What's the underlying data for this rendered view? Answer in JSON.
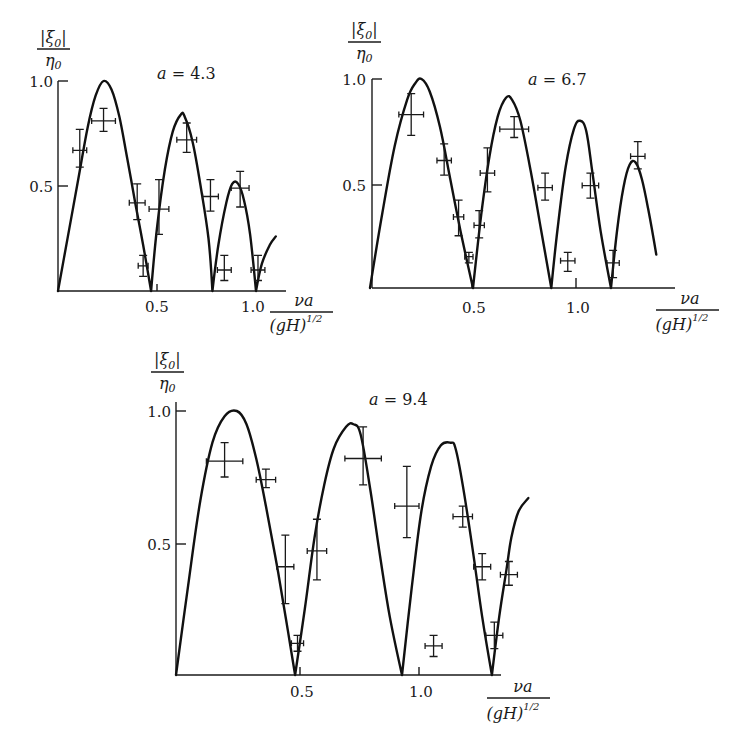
{
  "chart_data": [
    {
      "type": "line",
      "panel": "top-left",
      "title": "a = 4.3",
      "title_var": "a",
      "title_value": "4.3",
      "ylabel_numerator": "|ξ0|",
      "ylabel_denominator": "η0",
      "xlabel_numerator": "νa",
      "xlabel_denominator": "(gH)^1/2",
      "xticks": [
        0.5,
        1.0
      ],
      "xtick_labels": [
        "0.5",
        "1.0"
      ],
      "yticks": [
        0.5,
        1.0
      ],
      "ytick_labels": [
        "0.5",
        "1.0"
      ],
      "xlim": [
        0,
        1.16
      ],
      "ylim": [
        0,
        1.0
      ],
      "grid": false,
      "layout": {
        "x0": 58,
        "y0": 291,
        "sx": 198,
        "sy": 210
      },
      "series": [
        {
          "name": "theory",
          "kind": "curve",
          "x": [
            0,
            0.05,
            0.1,
            0.15,
            0.19,
            0.23,
            0.27,
            0.31,
            0.35,
            0.39,
            0.43,
            0.47,
            0.5,
            0.54,
            0.58,
            0.62,
            0.64,
            0.68,
            0.72,
            0.76,
            0.78,
            0.81,
            0.85,
            0.88,
            0.91,
            0.94,
            0.97,
            1.0,
            1.03,
            1.07,
            1.1
          ],
          "y": [
            0,
            0.26,
            0.52,
            0.78,
            0.93,
            1.0,
            0.96,
            0.83,
            0.63,
            0.42,
            0.22,
            0.0,
            0.3,
            0.58,
            0.76,
            0.84,
            0.83,
            0.71,
            0.5,
            0.25,
            0.0,
            0.22,
            0.42,
            0.51,
            0.51,
            0.43,
            0.27,
            0.0,
            0.13,
            0.22,
            0.26
          ]
        },
        {
          "name": "measured",
          "kind": "errorbar",
          "points": [
            {
              "x": 0.11,
              "y": 0.67,
              "xerr": 0.035,
              "ylo": 0.59,
              "yhi": 0.77
            },
            {
              "x": 0.23,
              "y": 0.81,
              "xerr": 0.06,
              "ylo": 0.76,
              "yhi": 0.87
            },
            {
              "x": 0.4,
              "y": 0.42,
              "xerr": 0.04,
              "ylo": 0.34,
              "yhi": 0.51
            },
            {
              "x": 0.43,
              "y": 0.12,
              "xerr": 0.025,
              "ylo": 0.07,
              "yhi": 0.17
            },
            {
              "x": 0.51,
              "y": 0.39,
              "xerr": 0.05,
              "ylo": 0.27,
              "yhi": 0.53
            },
            {
              "x": 0.65,
              "y": 0.72,
              "xerr": 0.05,
              "ylo": 0.66,
              "yhi": 0.8
            },
            {
              "x": 0.77,
              "y": 0.45,
              "xerr": 0.04,
              "ylo": 0.38,
              "yhi": 0.53
            },
            {
              "x": 0.84,
              "y": 0.1,
              "xerr": 0.035,
              "ylo": 0.05,
              "yhi": 0.17
            },
            {
              "x": 0.92,
              "y": 0.49,
              "xerr": 0.045,
              "ylo": 0.4,
              "yhi": 0.57
            },
            {
              "x": 1.01,
              "y": 0.1,
              "xerr": 0.035,
              "ylo": 0.05,
              "yhi": 0.17
            }
          ]
        }
      ]
    },
    {
      "type": "line",
      "panel": "top-right",
      "title": "a = 6.7",
      "title_var": "a",
      "title_value": "6.7",
      "ylabel_numerator": "|ξ0|",
      "ylabel_denominator": "η0",
      "xlabel_numerator": "νa",
      "xlabel_denominator": "(gH)^1/2",
      "xticks": [
        0.5,
        1.0
      ],
      "xtick_labels": [
        "0.5",
        "1.0"
      ],
      "yticks": [
        0.5,
        1.0
      ],
      "ytick_labels": [
        "0.5",
        "1.0"
      ],
      "xlim": [
        0,
        1.48
      ],
      "ylim": [
        0,
        1.0
      ],
      "grid": false,
      "layout": {
        "x0": 370,
        "y0": 288,
        "sx": 206,
        "sy": 209
      },
      "series": [
        {
          "name": "theory",
          "kind": "curve",
          "x": [
            0,
            0.06,
            0.12,
            0.18,
            0.22,
            0.25,
            0.29,
            0.34,
            0.39,
            0.44,
            0.5,
            0.54,
            0.58,
            0.62,
            0.66,
            0.69,
            0.73,
            0.78,
            0.83,
            0.88,
            0.91,
            0.95,
            0.99,
            1.02,
            1.05,
            1.08,
            1.12,
            1.17,
            1.2,
            1.23,
            1.26,
            1.29,
            1.32,
            1.35,
            1.39
          ],
          "y": [
            0,
            0.36,
            0.68,
            0.9,
            0.98,
            1.0,
            0.94,
            0.77,
            0.52,
            0.27,
            0.0,
            0.35,
            0.63,
            0.82,
            0.91,
            0.9,
            0.8,
            0.56,
            0.28,
            0.0,
            0.28,
            0.58,
            0.76,
            0.8,
            0.75,
            0.55,
            0.27,
            0.0,
            0.28,
            0.48,
            0.59,
            0.6,
            0.52,
            0.38,
            0.16
          ]
        },
        {
          "name": "measured",
          "kind": "errorbar",
          "points": [
            {
              "x": 0.2,
              "y": 0.83,
              "xerr": 0.06,
              "ylo": 0.73,
              "yhi": 0.93
            },
            {
              "x": 0.36,
              "y": 0.61,
              "xerr": 0.035,
              "ylo": 0.54,
              "yhi": 0.69
            },
            {
              "x": 0.43,
              "y": 0.34,
              "xerr": 0.025,
              "ylo": 0.25,
              "yhi": 0.42
            },
            {
              "x": 0.48,
              "y": 0.15,
              "xerr": 0.02,
              "ylo": 0.12,
              "yhi": 0.17
            },
            {
              "x": 0.53,
              "y": 0.3,
              "xerr": 0.025,
              "ylo": 0.24,
              "yhi": 0.37
            },
            {
              "x": 0.57,
              "y": 0.55,
              "xerr": 0.035,
              "ylo": 0.46,
              "yhi": 0.67
            },
            {
              "x": 0.7,
              "y": 0.76,
              "xerr": 0.07,
              "ylo": 0.72,
              "yhi": 0.82
            },
            {
              "x": 0.85,
              "y": 0.48,
              "xerr": 0.035,
              "ylo": 0.42,
              "yhi": 0.55
            },
            {
              "x": 0.96,
              "y": 0.13,
              "xerr": 0.035,
              "ylo": 0.08,
              "yhi": 0.17
            },
            {
              "x": 1.07,
              "y": 0.49,
              "xerr": 0.04,
              "ylo": 0.43,
              "yhi": 0.55
            },
            {
              "x": 1.18,
              "y": 0.12,
              "xerr": 0.03,
              "ylo": 0.05,
              "yhi": 0.18
            },
            {
              "x": 1.3,
              "y": 0.63,
              "xerr": 0.035,
              "ylo": 0.57,
              "yhi": 0.7
            }
          ]
        }
      ]
    },
    {
      "type": "line",
      "panel": "bottom",
      "title": "a = 9.4",
      "title_var": "a",
      "title_value": "9.4",
      "ylabel_numerator": "|ξ0|",
      "ylabel_denominator": "η0",
      "xlabel_numerator": "νa",
      "xlabel_denominator": "(gH)^1/2",
      "xticks": [
        0.5,
        1.0
      ],
      "xtick_labels": [
        "0.5",
        "1.0"
      ],
      "yticks": [
        0.5,
        1.0
      ],
      "ytick_labels": [
        "0.5",
        "1.0"
      ],
      "xlim": [
        0,
        1.35
      ],
      "ylim": [
        0,
        1.0
      ],
      "grid": false,
      "layout": {
        "x0": 176,
        "y0": 675,
        "sx": 243,
        "sy": 264
      },
      "series": [
        {
          "name": "theory",
          "kind": "curve",
          "x": [
            0,
            0.05,
            0.1,
            0.15,
            0.2,
            0.25,
            0.29,
            0.33,
            0.37,
            0.42,
            0.46,
            0.49,
            0.53,
            0.57,
            0.61,
            0.65,
            0.7,
            0.73,
            0.76,
            0.8,
            0.84,
            0.88,
            0.93,
            0.97,
            1.01,
            1.05,
            1.09,
            1.13,
            1.15,
            1.18,
            1.22,
            1.26,
            1.3,
            1.33,
            1.36,
            1.38,
            1.41,
            1.45
          ],
          "y": [
            0,
            0.34,
            0.66,
            0.88,
            0.98,
            1.0,
            0.95,
            0.82,
            0.64,
            0.39,
            0.17,
            0.0,
            0.25,
            0.52,
            0.72,
            0.86,
            0.94,
            0.95,
            0.91,
            0.7,
            0.45,
            0.22,
            0.0,
            0.33,
            0.62,
            0.79,
            0.87,
            0.88,
            0.86,
            0.72,
            0.48,
            0.22,
            0.0,
            0.22,
            0.4,
            0.52,
            0.62,
            0.67
          ]
        },
        {
          "name": "measured",
          "kind": "errorbar",
          "points": [
            {
              "x": 0.2,
              "y": 0.81,
              "xerr": 0.075,
              "ylo": 0.75,
              "yhi": 0.88
            },
            {
              "x": 0.37,
              "y": 0.74,
              "xerr": 0.04,
              "ylo": 0.71,
              "yhi": 0.78
            },
            {
              "x": 0.45,
              "y": 0.41,
              "xerr": 0.035,
              "ylo": 0.27,
              "yhi": 0.53
            },
            {
              "x": 0.5,
              "y": 0.12,
              "xerr": 0.025,
              "ylo": 0.09,
              "yhi": 0.15
            },
            {
              "x": 0.58,
              "y": 0.47,
              "xerr": 0.04,
              "ylo": 0.36,
              "yhi": 0.59
            },
            {
              "x": 0.77,
              "y": 0.82,
              "xerr": 0.075,
              "ylo": 0.72,
              "yhi": 0.94
            },
            {
              "x": 0.95,
              "y": 0.64,
              "xerr": 0.05,
              "ylo": 0.52,
              "yhi": 0.79
            },
            {
              "x": 1.06,
              "y": 0.11,
              "xerr": 0.035,
              "ylo": 0.07,
              "yhi": 0.15
            },
            {
              "x": 1.18,
              "y": 0.6,
              "xerr": 0.04,
              "ylo": 0.56,
              "yhi": 0.64
            },
            {
              "x": 1.26,
              "y": 0.41,
              "xerr": 0.035,
              "ylo": 0.36,
              "yhi": 0.46
            },
            {
              "x": 1.31,
              "y": 0.15,
              "xerr": 0.035,
              "ylo": 0.1,
              "yhi": 0.2
            },
            {
              "x": 1.37,
              "y": 0.38,
              "xerr": 0.035,
              "ylo": 0.34,
              "yhi": 0.43
            }
          ]
        }
      ]
    }
  ],
  "panels": [
    {
      "title_var": "a",
      "title_eq": " = ",
      "title_value": "4.3",
      "ylabel_num": "|ξ",
      "ylabel_num_sub": "0",
      "ylabel_num_end": "|",
      "ylabel_den": "η",
      "ylabel_den_sub": "0",
      "ytick_1": "1.0",
      "ytick_05": "0.5",
      "xtick_05": "0.5",
      "xtick_1": "1.0",
      "xlabel_num": "νa",
      "xlabel_den": "(gH)",
      "xlabel_den_sup": "1/2"
    },
    {
      "title_var": "a",
      "title_eq": " = ",
      "title_value": "6.7",
      "ylabel_num": "|ξ",
      "ylabel_num_sub": "0",
      "ylabel_num_end": "|",
      "ylabel_den": "η",
      "ylabel_den_sub": "0",
      "ytick_1": "1.0",
      "ytick_05": "0.5",
      "xtick_05": "0.5",
      "xtick_1": "1.0",
      "xlabel_num": "νa",
      "xlabel_den": "(gH)",
      "xlabel_den_sup": "1/2"
    },
    {
      "title_var": "a",
      "title_eq": " = ",
      "title_value": "9.4",
      "ylabel_num": "|ξ",
      "ylabel_num_sub": "0",
      "ylabel_num_end": "|",
      "ylabel_den": "η",
      "ylabel_den_sub": "0",
      "ytick_1": "1.0",
      "ytick_05": "0.5",
      "xtick_05": "0.5",
      "xtick_1": "1.0",
      "xlabel_num": "νa",
      "xlabel_den": "(gH)",
      "xlabel_den_sup": "1/2"
    }
  ]
}
